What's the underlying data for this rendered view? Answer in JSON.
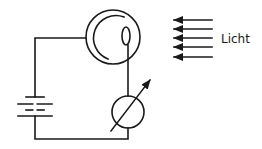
{
  "diagram": {
    "light_label": "Licht",
    "components": {
      "photocell": {
        "type": "photocell",
        "center": [
          113,
          37
        ],
        "outer_radius": 27,
        "cathode_radius": 22,
        "anode": {
          "cx": 126,
          "cy": 36,
          "rx": 4,
          "ry": 9
        }
      },
      "battery": {
        "type": "battery",
        "x": 35,
        "plates_y": [
          97,
          104,
          110,
          116
        ]
      },
      "meter": {
        "type": "adjustable-meter",
        "center": [
          128,
          112
        ],
        "radius": 16
      },
      "light_arrows": {
        "count": 5,
        "x_start": 212,
        "x_end": 172,
        "y": [
          20,
          29,
          38,
          47,
          57
        ]
      }
    },
    "colors": {
      "line": "#1a1a1a",
      "background": "#ffffff"
    }
  }
}
